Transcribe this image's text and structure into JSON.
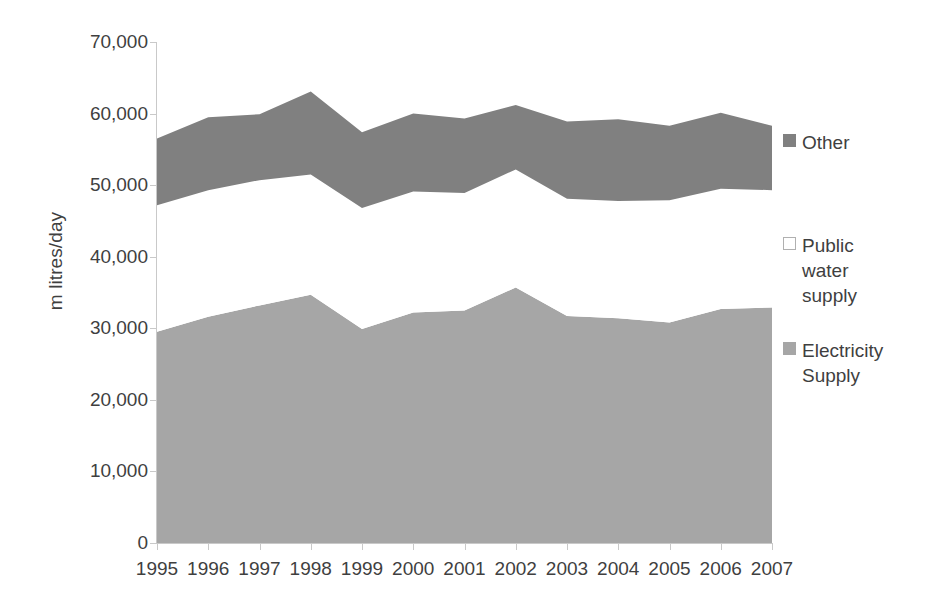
{
  "chart_data": {
    "type": "area",
    "stacked": true,
    "title": "",
    "xlabel": "",
    "ylabel": "m litres/day",
    "categories": [
      "1995",
      "1996",
      "1997",
      "1998",
      "1999",
      "2000",
      "2001",
      "2002",
      "2003",
      "2004",
      "2005",
      "2006",
      "2007"
    ],
    "x": [
      1995,
      1996,
      1997,
      1998,
      1999,
      2000,
      2001,
      2002,
      2003,
      2004,
      2005,
      2006,
      2007
    ],
    "ylim": [
      0,
      70000
    ],
    "yticks": [
      0,
      10000,
      20000,
      30000,
      40000,
      50000,
      60000,
      70000
    ],
    "ytick_labels": [
      "0",
      "10,000",
      "20,000",
      "30,000",
      "40,000",
      "50,000",
      "60,000",
      "70,000"
    ],
    "grid": false,
    "legend_position": "right",
    "series": [
      {
        "name": "Electricity Supply",
        "color": "#a6a6a6",
        "values": [
          29500,
          31600,
          33200,
          34700,
          29900,
          32200,
          32500,
          35700,
          31700,
          31400,
          30800,
          32700,
          32900
        ]
      },
      {
        "name": "Public water supply",
        "color": "#ffffff",
        "values": [
          17700,
          17700,
          17500,
          16800,
          16900,
          16900,
          16400,
          16500,
          16400,
          16400,
          17100,
          16800,
          16400
        ]
      },
      {
        "name": "Other",
        "color": "#808080",
        "values": [
          9300,
          10200,
          9200,
          11600,
          10600,
          10900,
          10400,
          9000,
          10800,
          11400,
          10400,
          10600,
          9000
        ]
      }
    ],
    "cumulative_tops": {
      "electricity": [
        29500,
        31600,
        33200,
        34700,
        29900,
        32200,
        32500,
        35700,
        31700,
        31400,
        30800,
        32700,
        32900
      ],
      "plus_public_water": [
        47200,
        49300,
        50700,
        51500,
        46800,
        49100,
        48900,
        52200,
        48100,
        47800,
        47900,
        49500,
        49300
      ],
      "total": [
        56500,
        59500,
        59900,
        63100,
        57400,
        60000,
        59300,
        61200,
        58900,
        59200,
        58300,
        60100,
        58300
      ]
    }
  },
  "axes": {
    "y_axis_title": "m litres/day",
    "y_tick_labels": [
      "70,000",
      "60,000",
      "50,000",
      "40,000",
      "30,000",
      "20,000",
      "10,000",
      "0"
    ],
    "x_tick_labels": [
      "1995",
      "1996",
      "1997",
      "1998",
      "1999",
      "2000",
      "2001",
      "2002",
      "2003",
      "2004",
      "2005",
      "2006",
      "2007"
    ]
  },
  "legend": {
    "entries": [
      {
        "label": "Other",
        "color": "#808080",
        "border": "#808080"
      },
      {
        "label": "Public\nwater\nsupply",
        "color": "#ffffff",
        "border": "#b0b0b0"
      },
      {
        "label": "Electricity\nSupply",
        "color": "#a6a6a6",
        "border": "#a6a6a6"
      }
    ]
  },
  "colors": {
    "other": "#808080",
    "public_water_supply": "#ffffff",
    "electricity_supply": "#a6a6a6",
    "axis": "#c9c9c9",
    "text": "#3f3f3f",
    "background": "#ffffff"
  }
}
